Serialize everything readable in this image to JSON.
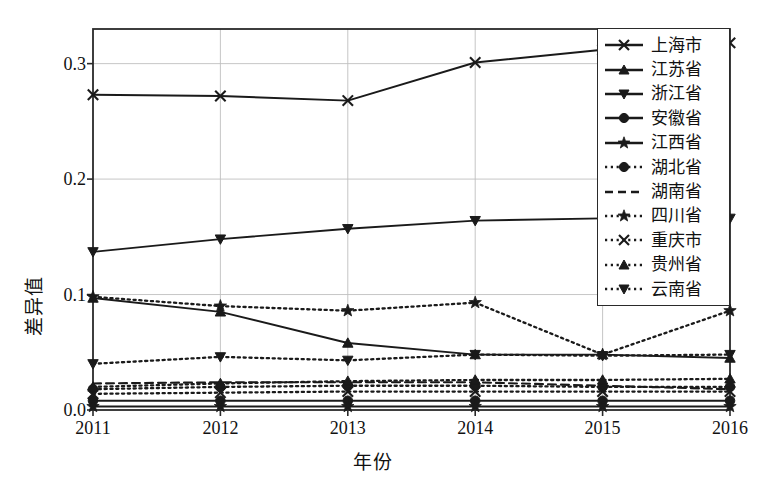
{
  "chart_data": {
    "type": "line",
    "title": "",
    "xlabel": "年份",
    "ylabel": "差异值",
    "categories": [
      "2011",
      "2012",
      "2013",
      "2014",
      "2015",
      "2016"
    ],
    "x": [
      2011,
      2012,
      2013,
      2014,
      2015,
      2016
    ],
    "xlim": [
      2011,
      2016
    ],
    "ylim": [
      0.0,
      0.33
    ],
    "yticks": [
      "0.0",
      "0.1",
      "0.2",
      "0.3"
    ],
    "ytick_values": [
      0.0,
      0.1,
      0.2,
      0.3
    ],
    "grid": true,
    "grid_axis": "both",
    "legend_position": "upper right outside",
    "series": [
      {
        "name": "上海市",
        "marker": "x",
        "linestyle": "solid",
        "values": [
          0.273,
          0.272,
          0.268,
          0.301,
          0.312,
          0.318
        ]
      },
      {
        "name": "江苏省",
        "marker": "triangle-up",
        "linestyle": "solid",
        "values": [
          0.097,
          0.085,
          0.058,
          0.048,
          0.048,
          0.045
        ]
      },
      {
        "name": "浙江省",
        "marker": "triangle-down",
        "linestyle": "solid",
        "values": [
          0.137,
          0.148,
          0.157,
          0.164,
          0.166,
          0.166
        ]
      },
      {
        "name": "安徽省",
        "marker": "circle",
        "linestyle": "solid",
        "values": [
          0.008,
          0.008,
          0.008,
          0.008,
          0.008,
          0.008
        ]
      },
      {
        "name": "江西省",
        "marker": "star",
        "linestyle": "solid",
        "values": [
          0.003,
          0.003,
          0.003,
          0.003,
          0.003,
          0.003
        ]
      },
      {
        "name": "湖北省",
        "marker": "circle",
        "linestyle": "dotted",
        "values": [
          0.018,
          0.02,
          0.021,
          0.021,
          0.02,
          0.02
        ]
      },
      {
        "name": "湖南省",
        "marker": "none",
        "linestyle": "dashed",
        "values": [
          0.023,
          0.024,
          0.024,
          0.024,
          0.021,
          0.018
        ]
      },
      {
        "name": "四川省",
        "marker": "star",
        "linestyle": "dotted",
        "values": [
          0.098,
          0.09,
          0.086,
          0.093,
          0.048,
          0.086
        ]
      },
      {
        "name": "重庆市",
        "marker": "x",
        "linestyle": "dotted",
        "values": [
          0.014,
          0.015,
          0.016,
          0.016,
          0.016,
          0.016
        ]
      },
      {
        "name": "贵州省",
        "marker": "triangle-up",
        "linestyle": "dotted",
        "values": [
          0.02,
          0.023,
          0.025,
          0.026,
          0.026,
          0.027
        ]
      },
      {
        "name": "云南省",
        "marker": "triangle-down",
        "linestyle": "dotted",
        "values": [
          0.04,
          0.046,
          0.043,
          0.048,
          0.047,
          0.048
        ]
      }
    ]
  },
  "legend": {
    "items": [
      {
        "label": "上海市"
      },
      {
        "label": "江苏省"
      },
      {
        "label": "浙江省"
      },
      {
        "label": "安徽省"
      },
      {
        "label": "江西省"
      },
      {
        "label": "湖北省"
      },
      {
        "label": "湖南省"
      },
      {
        "label": "四川省"
      },
      {
        "label": "重庆市"
      },
      {
        "label": "贵州省"
      },
      {
        "label": "云南省"
      }
    ]
  },
  "colors": {
    "line": "#1a1a1a",
    "grid": "#bfbfbf",
    "axis": "#2a2a2a",
    "background": "#ffffff"
  }
}
